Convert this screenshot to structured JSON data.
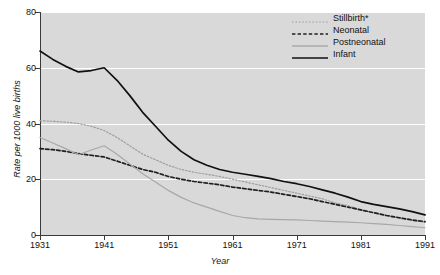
{
  "chart_data": {
    "type": "line",
    "title": "",
    "xlabel": "Year",
    "ylabel": "Rate per 1000 live births",
    "xlim": [
      1931,
      1991
    ],
    "ylim": [
      0,
      80
    ],
    "xticks": [
      "1931",
      "1941",
      "1951",
      "1961",
      "1971",
      "1981",
      "1991"
    ],
    "yticks": [
      "0",
      "20",
      "40",
      "60",
      "80"
    ],
    "grid": "horizontal-white",
    "legend_position": "top-right",
    "x": [
      1931,
      1933,
      1935,
      1937,
      1939,
      1941,
      1943,
      1945,
      1947,
      1949,
      1951,
      1953,
      1955,
      1957,
      1959,
      1961,
      1963,
      1965,
      1967,
      1969,
      1971,
      1973,
      1975,
      1977,
      1979,
      1981,
      1983,
      1985,
      1987,
      1989,
      1991
    ],
    "series": [
      {
        "name": "Stillbirth*",
        "color": "#9e9e9e",
        "style": "dotted",
        "values": [
          41.0,
          40.8,
          40.5,
          40.0,
          39.0,
          37.5,
          35.0,
          32.0,
          29.0,
          27.0,
          25.0,
          23.5,
          22.5,
          21.8,
          21.0,
          20.0,
          19.0,
          18.0,
          17.0,
          16.0,
          15.0,
          14.0,
          13.0,
          11.5,
          10.5,
          9.0,
          8.0,
          7.0,
          6.0,
          5.2,
          4.6
        ]
      },
      {
        "name": "Neonatal",
        "color": "#1f1f1f",
        "style": "dashed",
        "values": [
          31.0,
          30.6,
          30.0,
          29.2,
          28.6,
          28.0,
          26.5,
          25.0,
          23.5,
          22.5,
          21.0,
          20.0,
          19.2,
          18.6,
          18.0,
          17.2,
          16.6,
          16.0,
          15.4,
          14.6,
          13.8,
          13.0,
          12.0,
          11.0,
          10.0,
          9.0,
          8.0,
          7.0,
          6.2,
          5.4,
          4.8
        ]
      },
      {
        "name": "Postneonatal",
        "color": "#a8a8a8",
        "style": "solid",
        "values": [
          35.0,
          33.0,
          31.0,
          28.8,
          30.5,
          32.0,
          29.0,
          25.5,
          22.0,
          19.0,
          16.0,
          13.5,
          11.5,
          10.0,
          8.5,
          7.0,
          6.2,
          5.8,
          5.6,
          5.5,
          5.4,
          5.2,
          5.0,
          4.8,
          4.6,
          4.4,
          4.1,
          3.8,
          3.4,
          3.0,
          2.6
        ]
      },
      {
        "name": "Infant",
        "color": "#111111",
        "style": "solid",
        "values": [
          66.0,
          63.0,
          60.5,
          58.5,
          59.0,
          60.0,
          55.5,
          50.0,
          44.0,
          39.0,
          34.0,
          30.0,
          27.0,
          25.0,
          23.5,
          22.5,
          21.8,
          21.0,
          20.2,
          19.2,
          18.4,
          17.4,
          16.2,
          15.0,
          13.6,
          12.0,
          11.0,
          10.2,
          9.4,
          8.4,
          7.2
        ]
      }
    ]
  },
  "legend": {
    "items": [
      {
        "label": "Stillbirth*"
      },
      {
        "label": "Neonatal"
      },
      {
        "label": "Postneonatal"
      },
      {
        "label": "Infant"
      }
    ]
  }
}
